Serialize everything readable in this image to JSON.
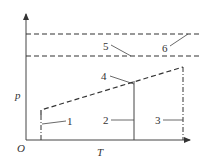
{
  "diagram": {
    "type": "p-T phase/constraint diagram",
    "axes": {
      "origin_label": "O",
      "x_label": "T",
      "y_label": "p"
    },
    "curve_labels": [
      "1",
      "2",
      "3",
      "4",
      "5",
      "6"
    ],
    "elements": [
      {
        "id": "1",
        "label": "1",
        "style": "dash-dot vertical",
        "description": "vertical dash-dot line at low T"
      },
      {
        "id": "2",
        "label": "2",
        "style": "solid vertical",
        "description": "solid vertical line at mid T"
      },
      {
        "id": "3",
        "label": "3",
        "style": "dash-dot vertical",
        "description": "vertical dash-dot line at high T"
      },
      {
        "id": "4",
        "label": "4",
        "style": "dashed sloped",
        "description": "dashed line rising with T"
      },
      {
        "id": "5",
        "label": "5",
        "style": "dashed horizontal",
        "description": "lower horizontal dashed line"
      },
      {
        "id": "6",
        "label": "6",
        "style": "dashed horizontal",
        "description": "upper horizontal dashed line"
      }
    ],
    "colors": {
      "line": "#333333",
      "background": "#ffffff"
    }
  }
}
